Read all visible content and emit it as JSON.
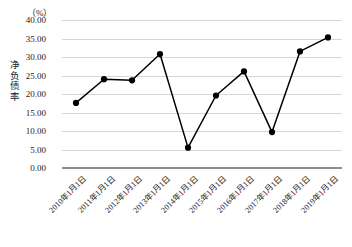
{
  "chart_data": {
    "type": "line",
    "title": "",
    "subtitle": "",
    "unit_label": "（%）",
    "ylabel": "净负债率",
    "xlabel": "",
    "categories": [
      "2010年1月1日",
      "2011年1月1日",
      "2012年1月1日",
      "2013年1月1日",
      "2014年1月1日",
      "2015年1月1日",
      "2016年1月1日",
      "2017年1月1日",
      "2018年1月1日",
      "2019年1月1日"
    ],
    "values": [
      17.6,
      24.0,
      23.7,
      30.8,
      5.5,
      19.6,
      26.1,
      9.7,
      31.5,
      35.3
    ],
    "ylim": [
      0.0,
      40.0
    ],
    "ytick_step": 5.0,
    "ytick_labels": [
      "0.00",
      "5.00",
      "10.00",
      "15.00",
      "20.00",
      "25.00",
      "30.00",
      "35.00",
      "40.00"
    ],
    "grid": true,
    "legend": "none",
    "series_color": "#000000",
    "grid_color": "#d7d7d7",
    "axis_color": "#8c8c8c",
    "marker": "filled-circle"
  }
}
